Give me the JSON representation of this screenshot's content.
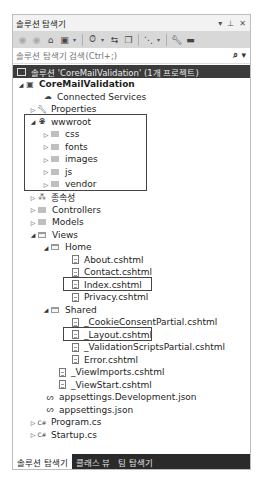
{
  "panel": {
    "title": "솔루션 탐색기",
    "controls": {
      "dropdown": "▾",
      "pin": "⊥",
      "close": "✕"
    }
  },
  "toolbar": {
    "items": [
      "back-icon",
      "forward-icon",
      "home-icon",
      "switch-views-icon",
      "pending-changes-filter-icon",
      "sync-icon",
      "collapse-all-icon",
      "show-all-files-icon",
      "properties-icon",
      "preview-icon"
    ]
  },
  "search": {
    "placeholder": "솔루션 탐색기 검색(Ctrl+;)",
    "value": ""
  },
  "solution": {
    "label": "솔루션 'CoreMailValidation' (1개 프로젝트)"
  },
  "tree": {
    "project": "CoreMailValidation",
    "connected_services": "Connected Services",
    "properties": "Properties",
    "wwwroot": "wwwroot",
    "wwwroot_children": [
      "css",
      "fonts",
      "images",
      "js",
      "vendor"
    ],
    "dependencies": "종속성",
    "controllers": "Controllers",
    "models": "Models",
    "views": "Views",
    "home": "Home",
    "home_files": [
      "About.cshtml",
      "Contact.cshtml",
      "Index.cshtml",
      "Privacy.cshtml"
    ],
    "shared": "Shared",
    "shared_files": [
      "_CookieConsentPartial.cshtml",
      "_Layout.cshtml",
      "_ValidationScriptsPartial.cshtml",
      "Error.cshtml"
    ],
    "view_imports": "_ViewImports.cshtml",
    "view_start": "_ViewStart.cshtml",
    "appsettings_dev": "appsettings.Development.json",
    "appsettings": "appsettings.json",
    "program": "Program.cs",
    "startup": "Startup.cs"
  },
  "tabs": [
    {
      "label": "솔루션 탐색기",
      "active": true
    },
    {
      "label": "클래스 뷰",
      "active": false
    },
    {
      "label": "팀 탐색기",
      "active": false
    }
  ]
}
